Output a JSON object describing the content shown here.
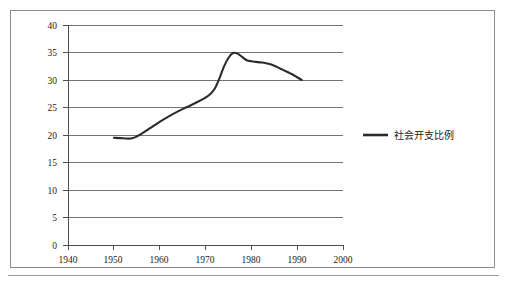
{
  "chart_data": {
    "type": "line",
    "title": "",
    "subtitle": "",
    "xlabel": "",
    "ylabel": "",
    "xlim": [
      1940,
      2000
    ],
    "ylim": [
      0,
      40
    ],
    "xticks": [
      1940,
      1950,
      1960,
      1970,
      1980,
      1990,
      2000
    ],
    "yticks": [
      0,
      5,
      10,
      15,
      20,
      25,
      30,
      35,
      40
    ],
    "grid": "horizontal",
    "legend_position": "right",
    "series": [
      {
        "name": "社会开支比例",
        "color": "#2b2b2b",
        "x": [
          1950,
          1952,
          1954,
          1956,
          1958,
          1960,
          1962,
          1964,
          1966,
          1968,
          1970,
          1971,
          1972,
          1973,
          1974,
          1975,
          1976,
          1977,
          1978,
          1979,
          1980,
          1981,
          1982,
          1983,
          1984,
          1985,
          1986,
          1987,
          1988,
          1989,
          1990,
          1991
        ],
        "values": [
          19.5,
          19.4,
          19.4,
          20.2,
          21.3,
          22.4,
          23.4,
          24.3,
          25.1,
          25.9,
          26.8,
          27.4,
          28.4,
          30.2,
          32.4,
          34.0,
          34.9,
          34.8,
          34.2,
          33.6,
          33.4,
          33.3,
          33.2,
          33.1,
          32.9,
          32.6,
          32.2,
          31.8,
          31.4,
          31.0,
          30.5,
          30.0
        ]
      }
    ]
  },
  "legend": {
    "entries": [
      {
        "label": "社会开支比例"
      }
    ]
  },
  "axes": {
    "y_tick_labels": [
      "40",
      "35",
      "30",
      "25",
      "20",
      "15",
      "10",
      "5",
      "0"
    ],
    "x_tick_labels": [
      "1940",
      "1950",
      "1960",
      "1970",
      "1980",
      "1990",
      "2000"
    ]
  }
}
